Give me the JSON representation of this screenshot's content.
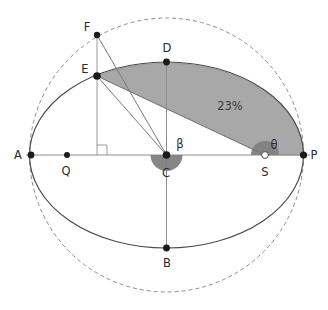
{
  "figure": {
    "canvas": {
      "width": 328,
      "height": 310,
      "background": "#ffffff"
    },
    "geometry": {
      "center": {
        "x": 166.5,
        "y": 155
      },
      "semi_major_axis": 137,
      "semi_minor_axis": 93,
      "auxiliary_circle_radius": 137
    }
  },
  "colors": {
    "stroke": "#4a4a4a",
    "axis": "#8c8c8c",
    "dashed_circle": "#8c8c8c",
    "shaded_sector": "#a8a8a8",
    "shaded_sector_edge": "#8f8f8f",
    "angle_wedge": "#7f7f7f",
    "point_fill": "#1a1a1a",
    "open_point_fill": "#ffffff",
    "label_text": "#2b2b2b",
    "helper_line": "#9a9a9a"
  },
  "points": [
    {
      "id": "A",
      "label": "A",
      "x": 31,
      "y": 155,
      "label_x": 18,
      "label_y": 159,
      "marker": "filled"
    },
    {
      "id": "Q",
      "label": "Q",
      "x": 67,
      "y": 155,
      "label_x": 62,
      "label_y": 175,
      "marker": "filled"
    },
    {
      "id": "C",
      "label": "C",
      "x": 166.5,
      "y": 155,
      "label_x": 161,
      "label_y": 177,
      "marker": "filled"
    },
    {
      "id": "S",
      "label": "S",
      "x": 265,
      "y": 155,
      "label_x": 260,
      "label_y": 176,
      "marker": "open"
    },
    {
      "id": "P",
      "label": "P",
      "x": 303.5,
      "y": 155,
      "label_x": 310,
      "label_y": 159,
      "marker": "filled"
    },
    {
      "id": "D",
      "label": "D",
      "x": 166.5,
      "y": 62,
      "label_x": 162,
      "label_y": 52,
      "marker": "filled"
    },
    {
      "id": "B",
      "label": "B",
      "x": 166.5,
      "y": 248,
      "label_x": 162,
      "label_y": 266,
      "marker": "filled"
    },
    {
      "id": "E",
      "label": "E",
      "x": 97,
      "y": 76,
      "label_x": 82,
      "label_y": 72,
      "marker": "filled"
    },
    {
      "id": "F",
      "label": "F",
      "x": 97,
      "y": 35,
      "label_x": 85,
      "label_y": 30,
      "marker": "filled"
    }
  ],
  "angles": [
    {
      "id": "beta",
      "label": "β",
      "vertex": "C",
      "label_x": 177,
      "label_y": 147,
      "radius": 16
    },
    {
      "id": "theta",
      "label": "θ",
      "vertex": "S",
      "label_x": 271,
      "label_y": 148,
      "radius": 14
    }
  ],
  "area": {
    "label": "23%",
    "label_x": 214,
    "label_y": 109,
    "description": "swept-sector-E-D-P-S"
  },
  "markers": {
    "right_angle": {
      "x": 97,
      "y": 155,
      "size": 10,
      "label": "right-angle-marker"
    }
  },
  "segments": [
    {
      "id": "major-axis",
      "from": "A",
      "to": "P",
      "style": "solid-axis"
    },
    {
      "id": "minor-axis",
      "from": "D",
      "to": "B",
      "style": "solid-axis"
    },
    {
      "id": "ordinate-FE",
      "from": "F",
      "to": "E",
      "style": "helper"
    },
    {
      "id": "ordinate-foot",
      "from": "E",
      "to": "foot",
      "style": "helper"
    },
    {
      "id": "radius-CF",
      "from": "C",
      "to": "F",
      "style": "solid"
    },
    {
      "id": "chord-ES",
      "from": "E",
      "to": "S",
      "style": "solid"
    },
    {
      "id": "radius-EC",
      "from": "E",
      "to": "C",
      "style": "solid"
    }
  ]
}
